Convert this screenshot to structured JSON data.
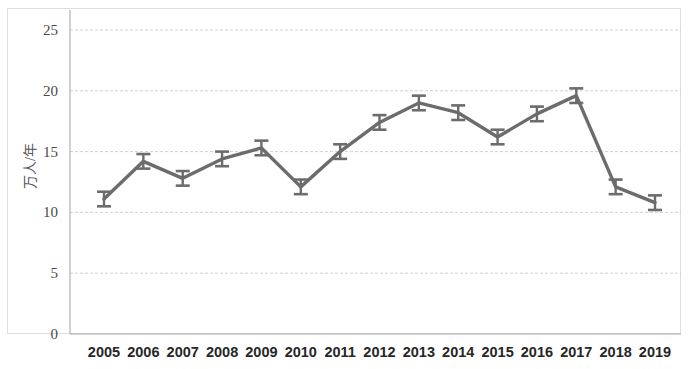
{
  "chart_data": {
    "type": "line",
    "title": "",
    "subtitle": "",
    "xlabel": "",
    "ylabel": "万人/年",
    "categories": [
      "2005",
      "2006",
      "2007",
      "2008",
      "2009",
      "2010",
      "2011",
      "2012",
      "2013",
      "2014",
      "2015",
      "2016",
      "2017",
      "2018",
      "2019"
    ],
    "values": [
      11.1,
      14.2,
      12.8,
      14.4,
      15.3,
      12.1,
      15.0,
      17.4,
      19.0,
      18.2,
      16.2,
      18.1,
      19.6,
      12.1,
      10.8
    ],
    "errors": [
      0.6,
      0.6,
      0.6,
      0.6,
      0.6,
      0.6,
      0.6,
      0.6,
      0.6,
      0.6,
      0.6,
      0.6,
      0.6,
      0.6,
      0.6
    ],
    "series": [
      {
        "name": "",
        "values": [
          11.1,
          14.2,
          12.8,
          14.4,
          15.3,
          12.1,
          15.0,
          17.4,
          19.0,
          18.2,
          16.2,
          18.1,
          19.6,
          12.1,
          10.8
        ],
        "errors": [
          0.6,
          0.6,
          0.6,
          0.6,
          0.6,
          0.6,
          0.6,
          0.6,
          0.6,
          0.6,
          0.6,
          0.6,
          0.6,
          0.6,
          0.6
        ]
      }
    ],
    "ylim": [
      0,
      25
    ],
    "yticks": [
      0,
      5,
      10,
      15,
      20,
      25
    ],
    "ytick_labels": [
      "0",
      "5",
      "10",
      "15",
      "20",
      "25"
    ],
    "grid": true,
    "grid_axis": "y",
    "legend": false,
    "legend_position": "none",
    "error_bars": true,
    "marker": "none",
    "line_color": "#6c6c6c",
    "grid_color": "#c9c9cf",
    "background_color": "#ffffff"
  },
  "axes": {
    "y_axis_title": "万人/年",
    "y_tick_labels": [
      "25",
      "20",
      "15",
      "10",
      "5",
      "0"
    ],
    "x_tick_labels": [
      "2005",
      "2006",
      "2007",
      "2008",
      "2009",
      "2010",
      "2011",
      "2012",
      "2013",
      "2014",
      "2015",
      "2016",
      "2017",
      "2018",
      "2019"
    ]
  }
}
